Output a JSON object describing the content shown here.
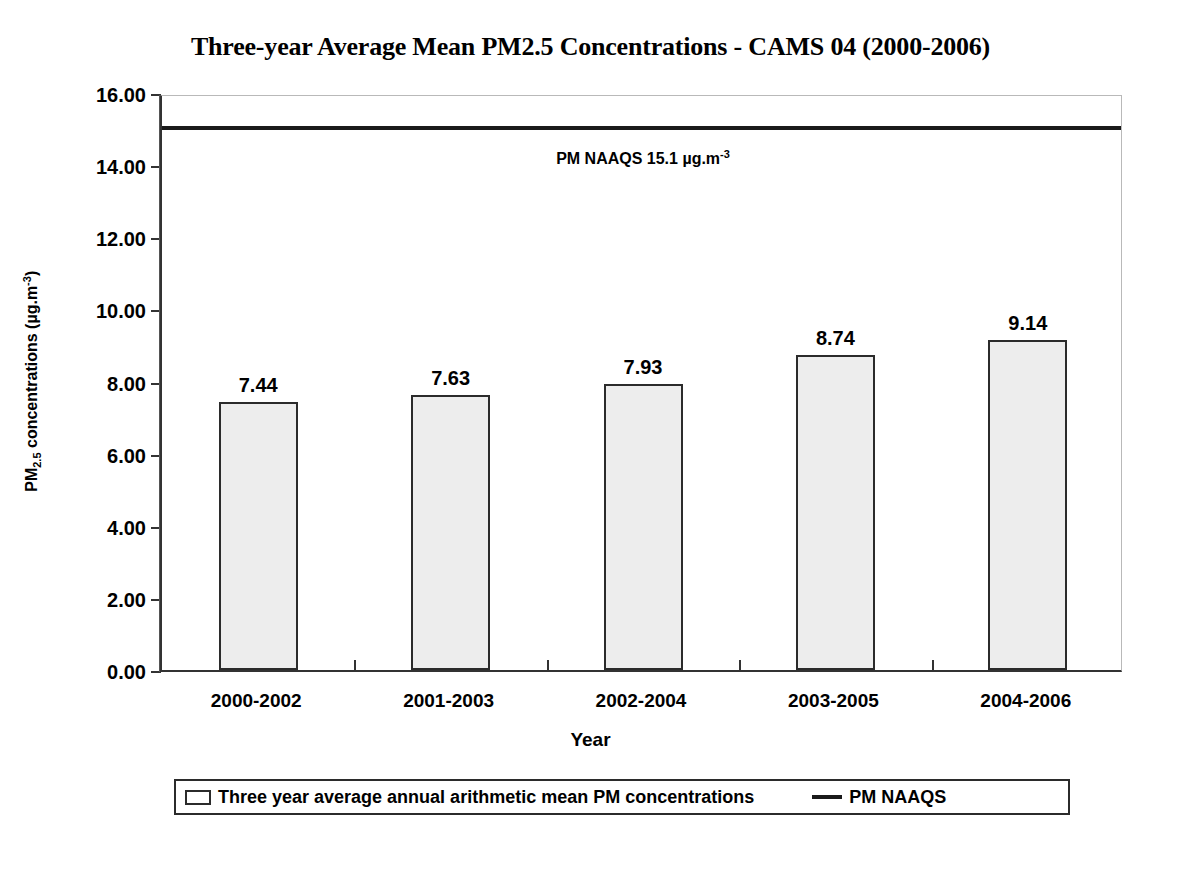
{
  "chart_data": {
    "type": "bar",
    "title": "Three-year Average Mean PM2.5 Concentrations - CAMS 04 (2000-2006)",
    "categories": [
      "2000-2002",
      "2001-2003",
      "2002-2004",
      "2003-2005",
      "2004-2006"
    ],
    "values": [
      7.44,
      7.63,
      7.93,
      8.74,
      9.14
    ],
    "value_labels": [
      "7.44",
      "7.63",
      "7.93",
      "8.74",
      "9.14"
    ],
    "series": [
      {
        "name": "Three year average annual arithmetic mean PM concentrations",
        "values": [
          7.44,
          7.63,
          7.93,
          8.74,
          9.14
        ]
      }
    ],
    "xlabel": "Year",
    "ylabel": "PM2.5 concentrations (ug.m-3)",
    "ylim": [
      0,
      16
    ],
    "ytick_values": [
      0,
      2,
      4,
      6,
      8,
      10,
      12,
      14,
      16
    ],
    "ytick_labels": [
      "0.00",
      "2.00",
      "4.00",
      "6.00",
      "8.00",
      "10.00",
      "12.00",
      "14.00",
      "16.00"
    ],
    "grid": false,
    "legend_position": "bottom",
    "reference_line": {
      "label": "PM NAAQS",
      "value": 15.1,
      "units": "ug.m-3",
      "annotation": "PM NAAQS 15.1 µg.m",
      "annotation_sup": "-3"
    },
    "bar_fill_color": "#ededed",
    "bar_border_color": "#2b2b2b",
    "line_color": "#1a1a1a"
  },
  "y_axis": {
    "title_main": "PM",
    "title_sub": "2.5",
    "title_mid": " concentrations (µg.m",
    "title_sup": "-3",
    "title_end": ")"
  },
  "x_axis": {
    "title": "Year"
  },
  "legend": {
    "bar_label": "Three year average annual arithmetic mean PM concentrations",
    "line_label": "PM NAAQS"
  }
}
